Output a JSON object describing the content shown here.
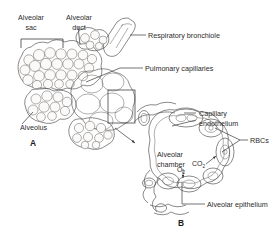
{
  "figure": {
    "type": "anatomical-line-diagram",
    "panels": [
      {
        "id": "A",
        "label": "A",
        "description": "Cluster of alveolar sacs attached to a respiratory bronchiole, with pulmonary capillaries shaded over the alveolar surface"
      },
      {
        "id": "B",
        "label": "B",
        "description": "Cross-section of a single alveolar chamber surrounded by capillaries containing red blood cells, showing gas exchange"
      }
    ],
    "labels": {
      "alveolar_sac": "Alveolar\nsac",
      "alveolar_sac_line1": "Alveolar",
      "alveolar_sac_line2": "sac",
      "alveolar_duct_line1": "Alveolar",
      "alveolar_duct_line2": "duct",
      "respiratory_bronchiole": "Respiratory bronchiole",
      "pulmonary_capillaries": "Pulmonary capillaries",
      "alveolus": "Alveolus",
      "capillary_endothelium_line1": "Capillary",
      "capillary_endothelium_line2": "endothelium",
      "rbcs": "RBCs",
      "alveolar_chamber_line1": "Alveolar",
      "alveolar_chamber_line2": "chamber",
      "alveolar_epithelium": "Alveolar epithelium",
      "co2": "CO",
      "co2_sub": "2",
      "o2": "O",
      "o2_sub": "2",
      "panel_a": "A",
      "panel_b": "B"
    },
    "colors": {
      "background": "#ffffff",
      "ink": "#4a4a4a",
      "text": "#2b2b2b",
      "leader": "#3a3a3a",
      "shade_dark": "#7d7a73",
      "shade_light": "#d8d5cf"
    }
  }
}
